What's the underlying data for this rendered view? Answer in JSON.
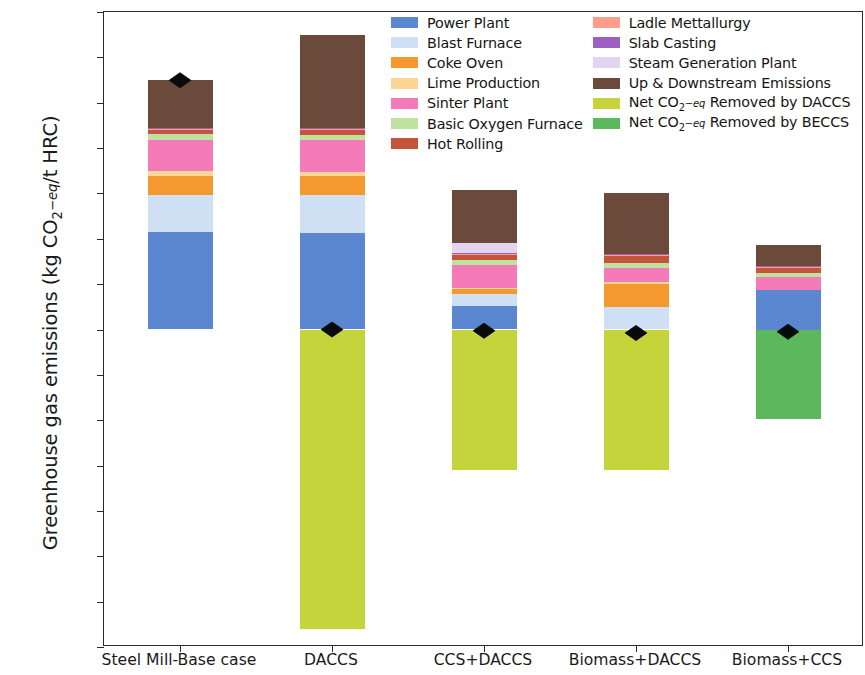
{
  "chart_data": {
    "type": "bar",
    "title": "",
    "subtitle": "",
    "xlabel": "",
    "ylabel": "Greenhouse gas emissions (kg CO2-eq/t HRC)",
    "ylim": [
      -2800,
      2800
    ],
    "ytick_step": 400,
    "yticks": [
      2800,
      2400,
      2000,
      1600,
      1200,
      800,
      400,
      0,
      -400,
      -800,
      -1200,
      -1600,
      -2000,
      -2400,
      -2800
    ],
    "ytick_labels": [
      "2800",
      "2400",
      "2000",
      "1600",
      "1200",
      "800",
      "400",
      "0",
      "−400",
      "−800",
      "−1200",
      "−1600",
      "−2000",
      "−2400",
      "−2800"
    ],
    "grid": false,
    "stacked": true,
    "legend_position": "upper center",
    "categories": [
      "Steel Mill-Base case",
      "DACCS",
      "CCS+DACCS",
      "Biomass+DACCS",
      "Biomass+CCS"
    ],
    "series": [
      {
        "name": "Power Plant",
        "color": "#5b87d0",
        "values": [
          860,
          855,
          205,
          0,
          350
        ]
      },
      {
        "name": "Blast Furnace",
        "color": "#cfe0f5",
        "values": [
          330,
          330,
          105,
          200,
          0
        ]
      },
      {
        "name": "Coke Oven",
        "color": "#f5992e",
        "values": [
          165,
          165,
          45,
          205,
          0
        ]
      },
      {
        "name": "Lime Production",
        "color": "#fcd694",
        "values": [
          40,
          40,
          15,
          15,
          0
        ]
      },
      {
        "name": "Sinter Plant",
        "color": "#f47bb7",
        "values": [
          280,
          280,
          195,
          125,
          110
        ]
      },
      {
        "name": "Basic Oxygen Furnace",
        "color": "#bfe2a0",
        "values": [
          45,
          45,
          45,
          45,
          40
        ]
      },
      {
        "name": "Hot Rolling",
        "color": "#c4543a",
        "values": [
          40,
          40,
          45,
          55,
          45
        ]
      },
      {
        "name": "Ladle Mettallurgy",
        "color": "#fc9e8a",
        "values": [
          10,
          10,
          10,
          10,
          10
        ]
      },
      {
        "name": "Slab Casting",
        "color": "#9d5fc0",
        "values": [
          8,
          8,
          8,
          8,
          8
        ]
      },
      {
        "name": "Steam Generation Plant",
        "color": "#e3d4f2",
        "values": [
          0,
          0,
          90,
          0,
          0
        ]
      },
      {
        "name": "Up & Downstream Emissions",
        "color": "#6b4a3c",
        "values": [
          420,
          820,
          470,
          545,
          185
        ]
      },
      {
        "name": "Net CO2-eq Removed by DACCS",
        "color": "#c5d43a",
        "values": [
          0,
          -2640,
          -1240,
          -1235,
          0
        ]
      },
      {
        "name": "Net CO2-eq Removed by BECCS",
        "color": "#5cb85c",
        "values": [
          0,
          0,
          0,
          0,
          -790
        ]
      }
    ],
    "net_markers": {
      "name": "Net emissions",
      "marker": "diamond",
      "color": "#0a0a0a",
      "values": [
        2198,
        0,
        -10,
        -30,
        -20
      ]
    },
    "totals_positive": [
      2198,
      2593,
      1233,
      1208,
      748
    ],
    "totals_negative": [
      0,
      -2640,
      -1240,
      -1235,
      -790
    ]
  },
  "legend": {
    "columns": [
      {
        "items": [
          {
            "label": "Power Plant",
            "color": "#5b87d0"
          },
          {
            "label": "Blast Furnace",
            "color": "#cfe0f5"
          },
          {
            "label": "Coke Oven",
            "color": "#f5992e"
          },
          {
            "label": "Lime Production",
            "color": "#fcd694"
          },
          {
            "label": "Sinter Plant",
            "color": "#f47bb7"
          },
          {
            "label": "Basic Oxygen Furnace",
            "color": "#bfe2a0"
          },
          {
            "label": "Hot Rolling",
            "color": "#c4543a"
          }
        ]
      },
      {
        "items": [
          {
            "label": "Ladle Mettallurgy",
            "color": "#fc9e8a"
          },
          {
            "label": "Slab Casting",
            "color": "#9d5fc0"
          },
          {
            "label": "Steam Generation Plant",
            "color": "#e3d4f2"
          },
          {
            "label": "Up & Downstream Emissions",
            "color": "#6b4a3c"
          },
          {
            "label": "Net CO2-eq Removed by DACCS",
            "color": "#c5d43a",
            "rich": "daccs"
          },
          {
            "label": "Net CO2-eq Removed by BECCS",
            "color": "#5cb85c",
            "rich": "beccs"
          }
        ]
      }
    ]
  },
  "axis": {
    "ylabel_prefix": "Greenhouse gas emissions (kg CO",
    "ylabel_sub": "2",
    "ylabel_eq": "−eq",
    "ylabel_suffix": "/t HRC)"
  }
}
